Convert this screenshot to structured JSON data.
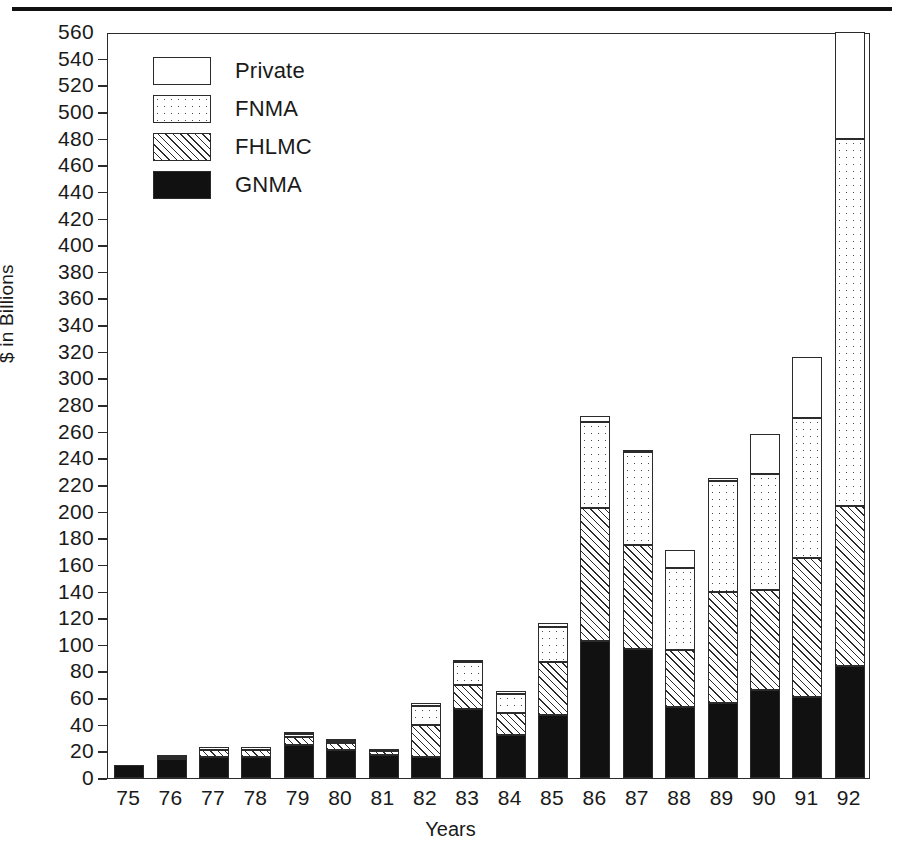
{
  "chart_data": {
    "type": "bar",
    "subtype": "stacked",
    "title": "",
    "xlabel": "Years",
    "ylabel": "$ in Billions",
    "ylim": [
      0,
      560
    ],
    "ytick_step": 20,
    "grid": false,
    "legend_position": "top-left",
    "categories": [
      "75",
      "76",
      "77",
      "78",
      "79",
      "80",
      "81",
      "82",
      "83",
      "84",
      "85",
      "86",
      "87",
      "88",
      "89",
      "90",
      "91",
      "92"
    ],
    "yticks": [
      0,
      20,
      40,
      60,
      80,
      100,
      120,
      140,
      160,
      180,
      200,
      220,
      240,
      260,
      280,
      300,
      320,
      340,
      360,
      380,
      400,
      420,
      440,
      460,
      480,
      500,
      520,
      540,
      560
    ],
    "series": [
      {
        "name": "GNMA",
        "swatch": "solid-black",
        "values": [
          10,
          14,
          16,
          16,
          25,
          21,
          17,
          16,
          52,
          32,
          47,
          103,
          97,
          53,
          56,
          66,
          61,
          84
        ]
      },
      {
        "name": "FHLMC",
        "swatch": "diagonal-hatch",
        "values": [
          0,
          2,
          5,
          5,
          6,
          5,
          3,
          24,
          18,
          17,
          40,
          100,
          78,
          43,
          84,
          75,
          104,
          120
        ]
      },
      {
        "name": "FNMA",
        "swatch": "dotted",
        "values": [
          0,
          1,
          2,
          2,
          2,
          2,
          2,
          14,
          17,
          14,
          26,
          64,
          70,
          62,
          83,
          87,
          105,
          276
        ]
      },
      {
        "name": "Private",
        "swatch": "white-open",
        "values": [
          0,
          0,
          0,
          0,
          1,
          1,
          0,
          2,
          1,
          2,
          3,
          5,
          1,
          13,
          2,
          30,
          46,
          80
        ]
      }
    ],
    "totals": [
      10,
      17,
      23,
      23,
      34,
      29,
      22,
      56,
      88,
      65,
      116,
      272,
      246,
      171,
      225,
      258,
      316,
      560
    ],
    "note_last_bar_clipped": "92 bar reaches the top of the plot frame at 560"
  },
  "legend": {
    "items": [
      {
        "label": "Private",
        "swatch": "private"
      },
      {
        "label": "FNMA",
        "swatch": "fnma"
      },
      {
        "label": "FHLMC",
        "swatch": "fhlmc"
      },
      {
        "label": "GNMA",
        "swatch": "gnma"
      }
    ]
  },
  "colors": {
    "ink": "#2b2b2b",
    "solid": "#111111",
    "paper": "#ffffff"
  }
}
